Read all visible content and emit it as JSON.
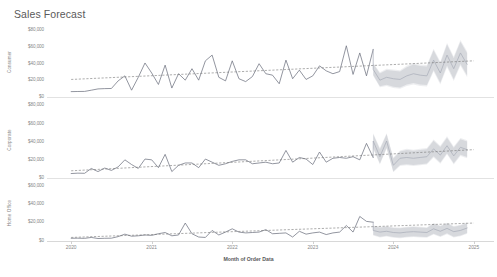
{
  "title": "Sales Forecast",
  "axis": {
    "x_title": "Month of Order Data",
    "x_ticks": [
      "2020",
      "2021",
      "2022",
      "2023",
      "2024",
      "2025"
    ]
  },
  "panels": [
    {
      "name": "Consumer",
      "y_ticks": [
        "$80,000",
        "$60,000",
        "$40,000",
        "$20,000",
        "$0"
      ]
    },
    {
      "name": "Corporate",
      "y_ticks": [
        "$80,000",
        "$60,000",
        "$40,000",
        "$20,000",
        "$0"
      ]
    },
    {
      "name": "Home Office",
      "y_ticks": [
        "$60,000",
        "$40,000",
        "$20,000",
        "$0"
      ]
    }
  ],
  "colors": {
    "actual_line": "#6f7380",
    "forecast_line": "#a8acb8",
    "trend_line": "#767676",
    "confidence_band": "#b9bcc4",
    "axis_text": "#868686",
    "title_text": "#5a5a5a"
  },
  "chart_data": {
    "type": "line",
    "title": "Sales Forecast",
    "xlabel": "Month of Order Data",
    "ylabel": "Sales",
    "grid": false,
    "legend": "none",
    "x_tick_labels": [
      "2020",
      "2021",
      "2022",
      "2023",
      "2024",
      "2025"
    ],
    "forecast_start": "2023-11",
    "x": [
      "2020-01",
      "2020-02",
      "2020-03",
      "2020-04",
      "2020-05",
      "2020-06",
      "2020-07",
      "2020-08",
      "2020-09",
      "2020-10",
      "2020-11",
      "2020-12",
      "2021-01",
      "2021-02",
      "2021-03",
      "2021-04",
      "2021-05",
      "2021-06",
      "2021-07",
      "2021-08",
      "2021-09",
      "2021-10",
      "2021-11",
      "2021-12",
      "2022-01",
      "2022-02",
      "2022-03",
      "2022-04",
      "2022-05",
      "2022-06",
      "2022-07",
      "2022-08",
      "2022-09",
      "2022-10",
      "2022-11",
      "2022-12",
      "2023-01",
      "2023-02",
      "2023-03",
      "2023-04",
      "2023-05",
      "2023-06",
      "2023-07",
      "2023-08",
      "2023-09",
      "2023-10"
    ],
    "x_forecast": [
      "2023-11",
      "2023-12",
      "2024-01",
      "2024-02",
      "2024-03",
      "2024-04",
      "2024-05",
      "2024-06",
      "2024-07",
      "2024-08",
      "2024-09",
      "2024-10",
      "2024-11",
      "2024-12",
      "2025-01"
    ],
    "series": [
      {
        "name": "Consumer",
        "panel": "Consumer",
        "ylim": [
          0,
          90000
        ],
        "y_ticks": [
          20000,
          40000,
          60000,
          80000
        ],
        "actual": [
          4000,
          4200,
          4300,
          6000,
          7800,
          8200,
          8400,
          19000,
          26000,
          6000,
          24000,
          44000,
          30000,
          14000,
          41000,
          9000,
          29000,
          20000,
          36000,
          20000,
          47000,
          55000,
          24000,
          19000,
          47000,
          22000,
          18000,
          25000,
          43000,
          29000,
          27000,
          15000,
          48000,
          22000,
          34000,
          21000,
          26000,
          40000,
          33000,
          29000,
          32000,
          68000,
          28000,
          58000,
          26000,
          63000
        ],
        "forecast": [
          35000,
          20000,
          24000,
          22000,
          21000,
          26000,
          29000,
          27000,
          26000,
          48000,
          30000,
          55000,
          36000,
          58000,
          42000
        ],
        "ci_low": [
          26000,
          10000,
          12000,
          9000,
          8000,
          12000,
          14000,
          12000,
          11000,
          32000,
          14000,
          38000,
          19000,
          40000,
          24000
        ],
        "ci_high": [
          44000,
          31000,
          36000,
          35000,
          34000,
          40000,
          44000,
          42000,
          41000,
          64000,
          46000,
          72000,
          53000,
          76000,
          60000
        ],
        "trend_start": 21000,
        "trend_end": 47000
      },
      {
        "name": "Corporate",
        "panel": "Corporate",
        "ylim": [
          0,
          90000
        ],
        "y_ticks": [
          20000,
          40000,
          60000,
          80000
        ],
        "actual": [
          2500,
          3000,
          2800,
          9000,
          5000,
          9500,
          6500,
          11000,
          20000,
          14000,
          9000,
          21000,
          20000,
          10000,
          27000,
          5000,
          13000,
          16000,
          16000,
          10000,
          21000,
          17000,
          13000,
          15000,
          18000,
          20000,
          20000,
          15000,
          16000,
          17000,
          15000,
          16000,
          32000,
          17000,
          23000,
          21000,
          14000,
          30000,
          17000,
          22000,
          23000,
          22000,
          24000,
          20000,
          41000,
          23000
        ],
        "forecast": [
          44000,
          24000,
          44000,
          13000,
          22000,
          23000,
          22000,
          23000,
          24000,
          34000,
          26000,
          38000,
          25000,
          36000,
          33000
        ],
        "ci_low": [
          34000,
          14000,
          34000,
          4000,
          12000,
          13000,
          12000,
          13000,
          14000,
          23000,
          15000,
          27000,
          14000,
          25000,
          22000
        ],
        "ci_high": [
          54000,
          35000,
          54000,
          23000,
          32000,
          34000,
          33000,
          34000,
          35000,
          46000,
          38000,
          50000,
          37000,
          48000,
          45000
        ],
        "trend_start": 6000,
        "trend_end": 33000
      },
      {
        "name": "Home Office",
        "panel": "Home Office",
        "ylim": [
          0,
          65000
        ],
        "y_ticks": [
          20000,
          40000,
          60000
        ],
        "actual": [
          1500,
          1600,
          1400,
          2500,
          1200,
          1500,
          1600,
          3500,
          6500,
          4000,
          4500,
          5500,
          5000,
          7000,
          8500,
          4500,
          5500,
          20000,
          7000,
          3000,
          2500,
          11000,
          5500,
          9000,
          13000,
          9000,
          8000,
          8500,
          9000,
          12000,
          7000,
          7500,
          8000,
          3000,
          10000,
          6500,
          8000,
          9000,
          6000,
          8000,
          9000,
          17000,
          9000,
          28000,
          22000,
          21000
        ],
        "forecast": [
          11000,
          9000,
          10000,
          8500,
          8000,
          9000,
          9500,
          9000,
          8500,
          13000,
          10000,
          13500,
          9500,
          11000,
          14000
        ],
        "ci_low": [
          5000,
          2500,
          3500,
          2000,
          1500,
          2500,
          3000,
          2500,
          2000,
          6000,
          3000,
          6500,
          2500,
          4000,
          7000
        ],
        "ci_high": [
          17000,
          15500,
          16500,
          15000,
          14500,
          15500,
          16000,
          15500,
          15000,
          20000,
          17000,
          20500,
          16500,
          18000,
          21000
        ],
        "trend_start": 2500,
        "trend_end": 20000
      }
    ]
  }
}
